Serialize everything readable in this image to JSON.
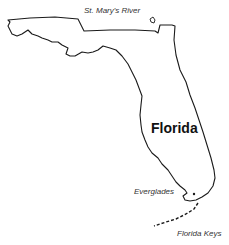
{
  "map": {
    "title": "Florida",
    "labels": {
      "river": "St. Mary's River",
      "everglades": "Everglades",
      "keys": "Florida Keys"
    },
    "colors": {
      "outline": "#1a1a1a",
      "background": "#ffffff",
      "text": "#333333"
    }
  }
}
